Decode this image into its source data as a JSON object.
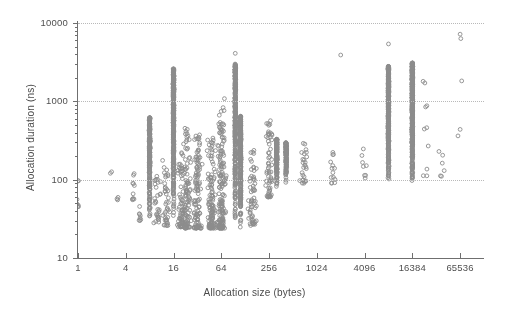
{
  "chart_data": {
    "type": "scatter",
    "title": "",
    "xlabel": "Allocation size (bytes)",
    "ylabel": "Allocation duration (ns)",
    "xscale": "log",
    "yscale": "log",
    "xlim": [
      1,
      131072
    ],
    "ylim": [
      10,
      10000
    ],
    "xticks": [
      1,
      4,
      16,
      64,
      256,
      1024,
      4096,
      16384,
      65536
    ],
    "xticklabels": [
      "1",
      "4",
      "16",
      "64",
      "256",
      "1024",
      "4096",
      "16384",
      "65536"
    ],
    "yticks": [
      10,
      100,
      1000,
      10000
    ],
    "yticklabels": [
      "10",
      "100",
      "1000",
      "10000"
    ],
    "grid": "horizontal-dotted",
    "legend": "none",
    "marker": "open-circle",
    "marker_color": "#8c8c8c",
    "marker_size_px": 4,
    "series": [
      {
        "name": "allocations",
        "description": "Allocation duration versus allocation size; dense vertical bands at power-of-two sizes (8, 16, 64, 96, 320, 8192, 16384) plus broad scatter.",
        "clusters": [
          {
            "x": 1,
            "y_range": [
              45,
              62
            ],
            "n": 6,
            "kind": "sparse-column"
          },
          {
            "x": 1,
            "y_range": [
              95,
              110
            ],
            "n": 2,
            "kind": "sparse-column"
          },
          {
            "x": 2.6,
            "y_range": [
              120,
              135
            ],
            "n": 2,
            "kind": "sparse-column"
          },
          {
            "x": 3.2,
            "y_range": [
              55,
              70
            ],
            "n": 3,
            "kind": "sparse-column"
          },
          {
            "x": 5,
            "y_range": [
              55,
              150
            ],
            "n": 10,
            "kind": "sparse-column"
          },
          {
            "x": 6,
            "y_range": [
              30,
              60
            ],
            "n": 8,
            "kind": "sparse-column"
          },
          {
            "x": 8,
            "y_range": [
              30,
              620
            ],
            "n": 260,
            "kind": "dense-column"
          },
          {
            "x": 10,
            "y_range": [
              28,
              120
            ],
            "n": 30,
            "kind": "scatter"
          },
          {
            "x": 13,
            "y_range": [
              26,
              200
            ],
            "n": 40,
            "kind": "scatter"
          },
          {
            "x": 16,
            "y_range": [
              25,
              2600
            ],
            "n": 420,
            "kind": "dense-column"
          },
          {
            "x": 20,
            "y_range": [
              25,
              300
            ],
            "n": 70,
            "kind": "scatter"
          },
          {
            "x": 24,
            "y_range": [
              24,
              500
            ],
            "n": 90,
            "kind": "scatter"
          },
          {
            "x": 32,
            "y_range": [
              24,
              400
            ],
            "n": 110,
            "kind": "scatter"
          },
          {
            "x": 48,
            "y_range": [
              24,
              350
            ],
            "n": 120,
            "kind": "scatter"
          },
          {
            "x": 64,
            "y_range": [
              24,
              1100
            ],
            "n": 160,
            "kind": "scatter"
          },
          {
            "x": 96,
            "y_range": [
              24,
              3000
            ],
            "n": 380,
            "kind": "dense-column"
          },
          {
            "x": 112,
            "y_range": [
              24,
              650
            ],
            "n": 300,
            "kind": "dense-column"
          },
          {
            "x": 160,
            "y_range": [
              26,
              260
            ],
            "n": 60,
            "kind": "scatter"
          },
          {
            "x": 256,
            "y_range": [
              60,
              600
            ],
            "n": 60,
            "kind": "scatter"
          },
          {
            "x": 320,
            "y_range": [
              75,
              330
            ],
            "n": 150,
            "kind": "dense-column"
          },
          {
            "x": 420,
            "y_range": [
              80,
              300
            ],
            "n": 120,
            "kind": "dense-column"
          },
          {
            "x": 700,
            "y_range": [
              90,
              330
            ],
            "n": 26,
            "kind": "scatter"
          },
          {
            "x": 1600,
            "y_range": [
              90,
              300
            ],
            "n": 14,
            "kind": "scatter"
          },
          {
            "x": 4096,
            "y_range": [
              100,
              260
            ],
            "n": 8,
            "kind": "scatter"
          },
          {
            "x": 8192,
            "y_range": [
              95,
              2800
            ],
            "n": 430,
            "kind": "dense-column"
          },
          {
            "x": 16384,
            "y_range": [
              80,
              3100
            ],
            "n": 520,
            "kind": "dense-column"
          },
          {
            "x": 24000,
            "y_range": [
              110,
              1900
            ],
            "n": 10,
            "kind": "scatter"
          },
          {
            "x": 40000,
            "y_range": [
              110,
              240
            ],
            "n": 6,
            "kind": "scatter"
          },
          {
            "x": 65536,
            "y_range": [
              160,
              7200
            ],
            "n": 4,
            "kind": "scatter"
          }
        ],
        "outliers": [
          {
            "x": 8192,
            "y": 5400
          },
          {
            "x": 65536,
            "y": 7200
          },
          {
            "x": 2048,
            "y": 3900
          },
          {
            "x": 96,
            "y": 4100
          },
          {
            "x": 16384,
            "y": 3100
          }
        ]
      }
    ]
  }
}
